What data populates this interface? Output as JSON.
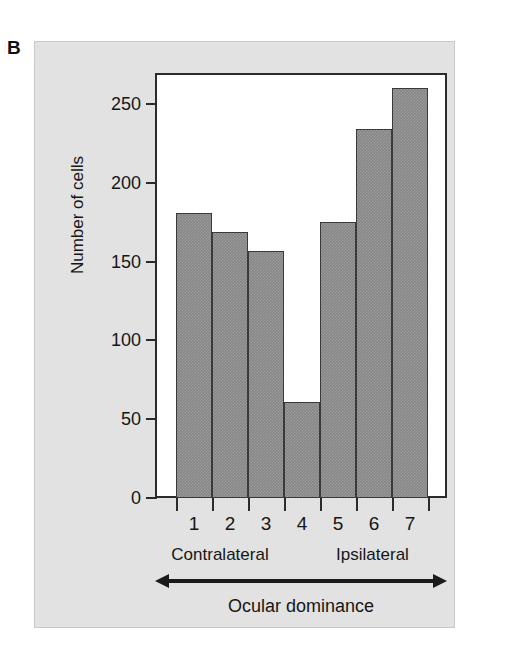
{
  "figure": {
    "panel_letter": "B",
    "background_color": "#e2e2e2",
    "bar_color": "#868686",
    "axis_color": "#2b2b2b"
  },
  "chart_data": {
    "type": "bar",
    "title": "",
    "annotation": "Monkey",
    "categories": [
      "1",
      "2",
      "3",
      "4",
      "5",
      "6",
      "7"
    ],
    "values": [
      181,
      169,
      157,
      61,
      175,
      234,
      260
    ],
    "xlabel": "Ocular dominance",
    "ylabel": "Number of cells",
    "ylim": [
      0,
      265
    ],
    "yticks": [
      0,
      50,
      100,
      150,
      200,
      250
    ],
    "ytick_labels": [
      "0",
      "50",
      "100",
      "150",
      "200",
      "250"
    ],
    "grid": false,
    "legend": "none",
    "axis_groups": [
      {
        "name": "contralateral",
        "label": "Contralateral",
        "arrow": "left",
        "categories": [
          "1",
          "2",
          "3",
          "4"
        ]
      },
      {
        "name": "ipsilateral",
        "label": "Ipsilateral",
        "arrow": "right",
        "categories": [
          "5",
          "6",
          "7"
        ]
      }
    ]
  }
}
